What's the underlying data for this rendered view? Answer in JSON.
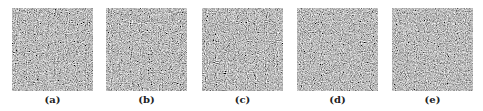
{
  "figure": {
    "panels": [
      {
        "label": "(a)",
        "content": "random-noise-image",
        "seed": 3
      },
      {
        "label": "(b)",
        "content": "random-noise-image",
        "seed": 11
      },
      {
        "label": "(c)",
        "content": "random-noise-image",
        "seed": 23
      },
      {
        "label": "(d)",
        "content": "random-noise-image",
        "seed": 37
      },
      {
        "label": "(e)",
        "content": "random-noise-image",
        "seed": 51
      }
    ],
    "colors": {
      "background": "#ffffff",
      "noise_mean": "#808080",
      "label_text": "#222222"
    }
  }
}
